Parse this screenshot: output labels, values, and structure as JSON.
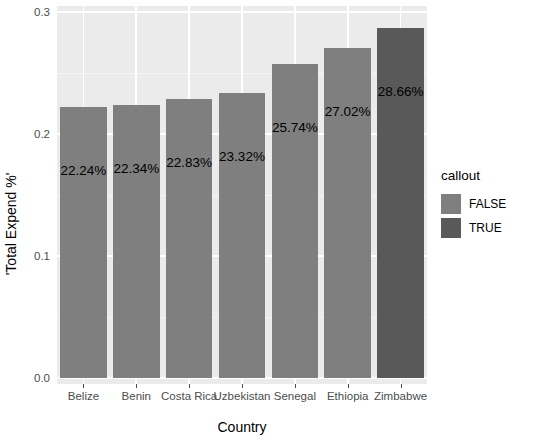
{
  "chart_data": {
    "type": "bar",
    "title": "",
    "subtitle": "",
    "xlabel": "Country",
    "ylabel": "'Total Expend %'",
    "categories": [
      "Belize",
      "Benin",
      "Costa Rica",
      "Uzbekistan",
      "Senegal",
      "Ethiopia",
      "Zimbabwe"
    ],
    "values": [
      0.2224,
      0.2234,
      0.2283,
      0.2332,
      0.2574,
      0.2702,
      0.2866
    ],
    "data_labels": [
      "22.24%",
      "22.34%",
      "22.83%",
      "23.32%",
      "25.74%",
      "27.02%",
      "28.66%"
    ],
    "series": [
      {
        "name": "Total Expend %",
        "values": [
          0.2224,
          0.2234,
          0.2283,
          0.2332,
          0.2574,
          0.2702,
          0.2866
        ]
      }
    ],
    "callout": [
      false,
      false,
      false,
      false,
      false,
      false,
      true
    ],
    "ylim": [
      0.0,
      0.3
    ],
    "yticks": [
      "0.0",
      "0.1",
      "0.2",
      "0.3"
    ],
    "ytick_values": [
      0.0,
      0.1,
      0.2,
      0.3
    ],
    "grid": true,
    "legend_position": "right",
    "colors": {
      "bar_false": "#7f7f7f",
      "bar_true": "#595959",
      "panel_background": "#ebebeb",
      "grid_major": "#ffffff",
      "grid_minor": "#f5f5f5",
      "axis_text": "#4d4d4d",
      "axis_title": "#000000"
    }
  },
  "legend": {
    "title": "callout",
    "items": [
      {
        "label": "FALSE",
        "color": "#7f7f7f"
      },
      {
        "label": "TRUE",
        "color": "#595959"
      }
    ]
  },
  "axes": {
    "x_title": "Country",
    "y_title": "'Total Expend %'"
  }
}
